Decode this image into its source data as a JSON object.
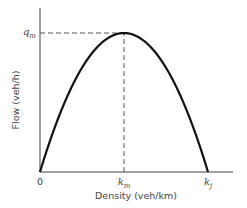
{
  "chart_data": {
    "type": "line",
    "title": "",
    "xlabel": "Density (veh/km)",
    "ylabel": "Flow (veh/h)",
    "x_ticks": [
      {
        "label": "0",
        "x": 0
      },
      {
        "label": "k",
        "sub": "m",
        "x": 0.5
      },
      {
        "label": "k",
        "sub": "j",
        "x": 1.0
      }
    ],
    "y_ticks": [
      {
        "label": "q",
        "sub": "m",
        "y": 1.0
      }
    ],
    "xlim": [
      0,
      1.15
    ],
    "ylim": [
      0,
      1.22
    ],
    "grid": false,
    "series": [
      {
        "name": "flow-density curve",
        "shape": "parabola",
        "description": "q = 4 q_m (k/k_j)(1 - k/k_j)",
        "x": [
          0,
          0.05,
          0.1,
          0.2,
          0.3,
          0.4,
          0.5,
          0.6,
          0.7,
          0.8,
          0.9,
          0.95,
          1.0
        ],
        "y": [
          0,
          0.19,
          0.36,
          0.64,
          0.84,
          0.96,
          1.0,
          0.96,
          0.84,
          0.64,
          0.36,
          0.19,
          0
        ]
      }
    ],
    "reference_lines": [
      {
        "name": "qm-guide",
        "style": "dashed",
        "from": [
          0,
          1.0
        ],
        "to": [
          0.5,
          1.0
        ]
      },
      {
        "name": "km-guide",
        "style": "dashed",
        "from": [
          0.5,
          0
        ],
        "to": [
          0.5,
          1.0
        ]
      }
    ]
  }
}
